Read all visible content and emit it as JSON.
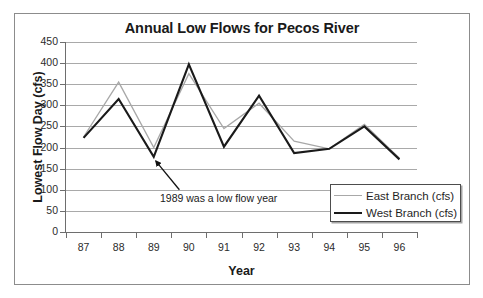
{
  "chart_data": {
    "type": "line",
    "title": "Annual Low Flows for Pecos River",
    "xlabel": "Year",
    "ylabel": "Lowest Flow Day (cfs)",
    "categories": [
      "87",
      "88",
      "89",
      "90",
      "91",
      "92",
      "93",
      "94",
      "95",
      "96"
    ],
    "ylim": [
      0,
      450
    ],
    "yticks": [
      0,
      50,
      100,
      150,
      200,
      250,
      300,
      350,
      400,
      450
    ],
    "ytick_labels": [
      "0",
      "50",
      "100",
      "150",
      "200",
      "250",
      "300",
      "350",
      "400",
      "450"
    ],
    "grid": true,
    "legend_position": "lower-right",
    "series": [
      {
        "name": "East Branch (cfs)",
        "color": "#a8a8a8",
        "width": 1.3,
        "values": [
          225,
          355,
          200,
          375,
          245,
          305,
          215,
          197,
          255,
          175
        ]
      },
      {
        "name": "West Branch (cfs)",
        "color": "#1a1a1a",
        "width": 2.1,
        "values": [
          223,
          315,
          178,
          397,
          202,
          323,
          187,
          197,
          250,
          172
        ]
      }
    ],
    "annotations": [
      {
        "text": "1989 was a low flow year",
        "arrow_from_x": 89.73,
        "arrow_from_y": 100,
        "arrow_to_x": 89.06,
        "arrow_to_y": 168
      }
    ]
  },
  "legend": {
    "items": [
      {
        "label": "East Branch (cfs)"
      },
      {
        "label": "West Branch (cfs)"
      }
    ]
  },
  "colors": {
    "east_branch": "#a8a8a8",
    "west_branch": "#1a1a1a",
    "gridline": "#a9a9a9",
    "axis": "#6e6e6e",
    "frame": "#8c8c8c",
    "text": "#1a1a1a"
  }
}
